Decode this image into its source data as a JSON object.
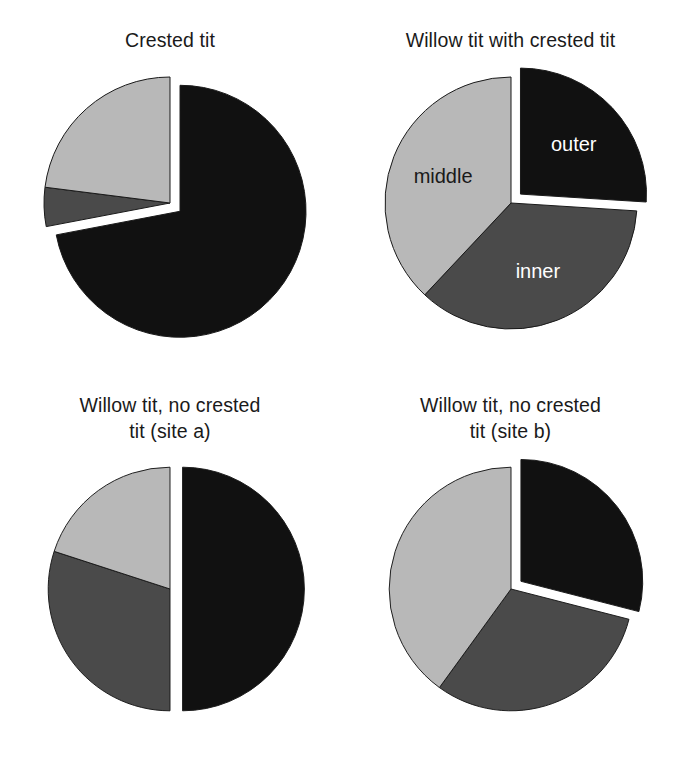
{
  "figure": {
    "background_color": "#ffffff",
    "width": 681,
    "height": 770
  },
  "palette": {
    "outer": "#111111",
    "inner": "#4a4a4a",
    "middle": "#b8b8b8",
    "edge": "#1a1a1a",
    "label_on_dark": "#ffffff",
    "label_on_light": "#1a1a1a"
  },
  "panels": {
    "crested_tit": {
      "title": "Crested tit",
      "labels": {
        "outer": "",
        "inner": "",
        "middle": ""
      }
    },
    "willow_with_crested": {
      "title": "Willow tit with crested tit",
      "labels": {
        "outer": "outer",
        "inner": "inner",
        "middle": "middle"
      }
    },
    "willow_no_crested_a": {
      "title": "Willow tit, no crested\ntit (site a)",
      "labels": {
        "outer": "",
        "inner": "",
        "middle": ""
      }
    },
    "willow_no_crested_b": {
      "title": "Willow tit, no crested\ntit (site b)",
      "labels": {
        "outer": "",
        "inner": "",
        "middle": ""
      }
    }
  },
  "chart_data": [
    {
      "type": "pie",
      "title": "Crested tit",
      "categories": [
        "outer",
        "inner",
        "middle"
      ],
      "values": [
        72,
        5,
        23
      ],
      "units": "percent",
      "colors": [
        "#111111",
        "#4a4a4a",
        "#b8b8b8"
      ],
      "exploded": [
        "outer"
      ],
      "start_angle_deg": 0,
      "direction": "clockwise",
      "show_labels": false,
      "legend": "none"
    },
    {
      "type": "pie",
      "title": "Willow tit with crested tit",
      "categories": [
        "outer",
        "inner",
        "middle"
      ],
      "values": [
        26,
        36,
        38
      ],
      "units": "percent",
      "colors": [
        "#111111",
        "#4a4a4a",
        "#b8b8b8"
      ],
      "exploded": [
        "outer"
      ],
      "start_angle_deg": 0,
      "direction": "clockwise",
      "show_labels": true,
      "legend": "none"
    },
    {
      "type": "pie",
      "title": "Willow tit, no crested tit (site a)",
      "categories": [
        "outer",
        "inner",
        "middle"
      ],
      "values": [
        50,
        30,
        20
      ],
      "units": "percent",
      "colors": [
        "#111111",
        "#4a4a4a",
        "#b8b8b8"
      ],
      "exploded": [
        "outer"
      ],
      "start_angle_deg": 0,
      "direction": "clockwise",
      "show_labels": false,
      "legend": "none"
    },
    {
      "type": "pie",
      "title": "Willow tit, no crested tit (site b)",
      "categories": [
        "outer",
        "inner",
        "middle"
      ],
      "values": [
        29,
        31,
        40
      ],
      "units": "percent",
      "colors": [
        "#111111",
        "#4a4a4a",
        "#b8b8b8"
      ],
      "exploded": [
        "outer"
      ],
      "start_angle_deg": 0,
      "direction": "clockwise",
      "show_labels": false,
      "legend": "none"
    }
  ]
}
